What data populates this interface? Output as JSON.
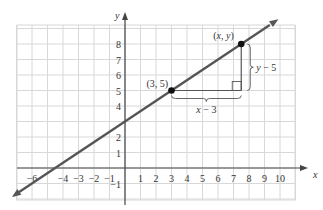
{
  "diagram": {
    "title": "",
    "axes": {
      "x_label": "x",
      "y_label": "y",
      "x_ticks": [
        "-6",
        "-4",
        "-3",
        "-2",
        "-1",
        "1",
        "2",
        "3",
        "4",
        "5",
        "6",
        "7",
        "8",
        "9",
        "10"
      ],
      "x_tick_values": [
        -6,
        -4,
        -3,
        -2,
        -1,
        1,
        2,
        3,
        4,
        5,
        6,
        7,
        8,
        9,
        10
      ],
      "y_ticks": [
        "-1",
        "1",
        "2",
        "4",
        "5",
        "6",
        "7",
        "8"
      ],
      "y_tick_values": [
        -1,
        1,
        2,
        4,
        5,
        6,
        7,
        8
      ],
      "x_range": [
        -7,
        11
      ],
      "y_range": [
        -2,
        9
      ]
    },
    "line": {
      "slope": 0.6667,
      "intercept": 3,
      "color": "#555555",
      "description": "line through (3,5) with y-intercept 3 and x-intercept -4.5"
    },
    "points": [
      {
        "label": "(3, 5)",
        "x": 3,
        "y": 5
      },
      {
        "label": "(x, y)",
        "x": 7.5,
        "y": 8
      }
    ],
    "annotations": {
      "horizontal_brace": "x − 3",
      "vertical_brace": "y − 5"
    },
    "colors": {
      "grid": "#d8d8d8",
      "axis": "#444444",
      "line": "#555555",
      "point": "#111111"
    }
  }
}
